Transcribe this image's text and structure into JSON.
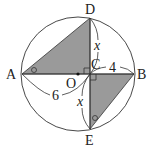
{
  "diagram": {
    "type": "geometry-circle",
    "colors": {
      "stroke": "#333333",
      "shade": "#9a9a9a",
      "background": "#ffffff"
    },
    "circle": {
      "center_label": "O"
    },
    "points": {
      "A": "A",
      "B": "B",
      "C": "C",
      "D": "D",
      "E": "E",
      "O": "O"
    },
    "segment_labels": {
      "AC": "6",
      "CB": "4",
      "CD": "x",
      "CE": "x"
    },
    "marks": {
      "angle_A": "circle-mark",
      "angle_E": "circle-mark",
      "right_angle_C_upper": "right-angle",
      "right_angle_C_lower": "right-angle"
    },
    "shaded_triangles": [
      "ACD",
      "BCE"
    ]
  }
}
